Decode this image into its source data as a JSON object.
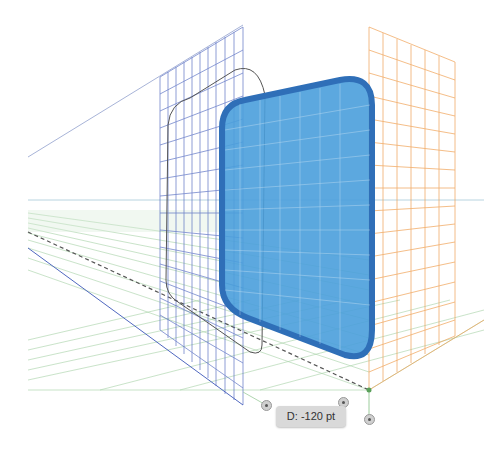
{
  "app": {
    "view": "Perspective Grid",
    "tooltip": {
      "label": "D: -120 pt"
    }
  },
  "grid": {
    "left_plane_color": "#5068c0",
    "right_plane_color": "#f0a050",
    "ground_plane_color": "#7fb87f",
    "horizon_color": "#a8c8d8"
  },
  "object": {
    "fill_color": "#4a9fdc",
    "stroke_color": "#2f6fb8",
    "shape": "rounded-rectangle"
  },
  "widgets": [
    {
      "name": "left-grid-extent-widget"
    },
    {
      "name": "right-grid-extent-widget"
    },
    {
      "name": "ground-level-widget"
    }
  ]
}
